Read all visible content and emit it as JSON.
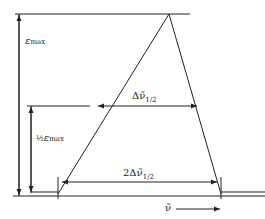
{
  "diagram": {
    "labels": {
      "eps_max": "ε",
      "eps_max_sub": "max",
      "half": "½",
      "half_eps": "ε",
      "half_eps_sub": "max",
      "fwhm": "Δν̃",
      "fwhm_sub": "1/2",
      "double_fwhm": "2Δν̃",
      "double_fwhm_sub": "1/2",
      "axis": "ν̃"
    },
    "colors": {
      "line": "#222222",
      "background": "#ffffff"
    }
  }
}
